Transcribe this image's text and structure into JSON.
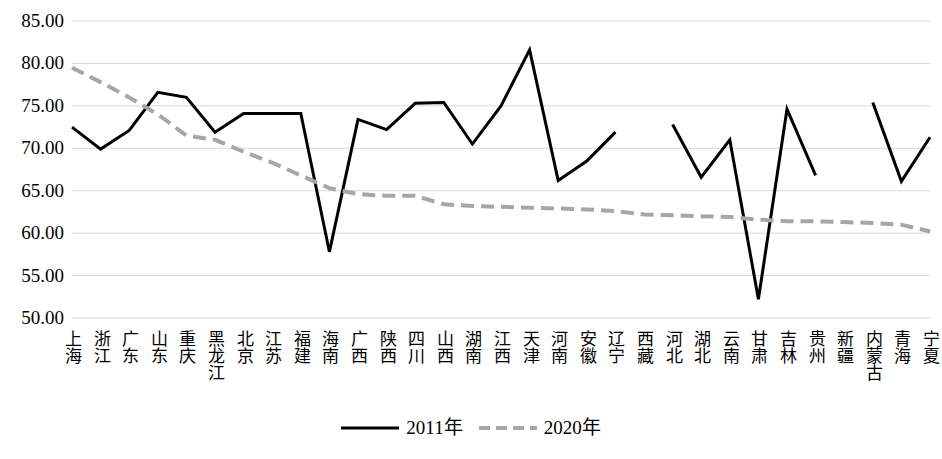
{
  "chart_data": {
    "type": "line",
    "title": "",
    "xlabel": "",
    "ylabel": "",
    "ylim": [
      50,
      85
    ],
    "y_ticks": [
      "50.00",
      "55.00",
      "60.00",
      "65.00",
      "70.00",
      "75.00",
      "80.00",
      "85.00"
    ],
    "grid": true,
    "legend_position": "bottom-center",
    "categories": [
      "上海",
      "浙江",
      "广东",
      "山东",
      "重庆",
      "黑龙江",
      "北京",
      "江苏",
      "福建",
      "海南",
      "广西",
      "陕西",
      "四川",
      "山西",
      "湖南",
      "江西",
      "天津",
      "河南",
      "安徽",
      "辽宁",
      "西藏",
      "河北",
      "湖北",
      "云南",
      "甘肃",
      "吉林",
      "贵州",
      "新疆",
      "内蒙古",
      "青海",
      "宁夏"
    ],
    "series": [
      {
        "name": "2011年",
        "color": "#000000",
        "style": "solid",
        "values": [
          72.5,
          69.9,
          72.1,
          76.6,
          76.0,
          71.9,
          74.1,
          74.1,
          74.1,
          57.8,
          73.4,
          72.2,
          75.3,
          75.4,
          70.5,
          75.0,
          81.6,
          66.2,
          68.5,
          71.9,
          null,
          72.8,
          66.6,
          71.0,
          52.2,
          74.6,
          66.8,
          null,
          75.4,
          66.1,
          71.3
        ]
      },
      {
        "name": "2020年",
        "color": "#a6a6a6",
        "style": "dashed",
        "values": [
          79.5,
          77.8,
          76.0,
          74.0,
          71.5,
          71.0,
          69.6,
          68.3,
          66.8,
          65.3,
          64.6,
          64.4,
          64.4,
          63.4,
          63.2,
          63.1,
          63.0,
          62.9,
          62.8,
          62.6,
          62.2,
          62.1,
          62.0,
          61.9,
          61.6,
          61.4,
          61.4,
          61.3,
          61.2,
          61.0,
          60.2
        ]
      }
    ]
  },
  "legend": {
    "entries": [
      {
        "label": "2011年",
        "color": "#000000",
        "style": "solid"
      },
      {
        "label": "2020年",
        "color": "#a6a6a6",
        "style": "dashed"
      }
    ]
  }
}
